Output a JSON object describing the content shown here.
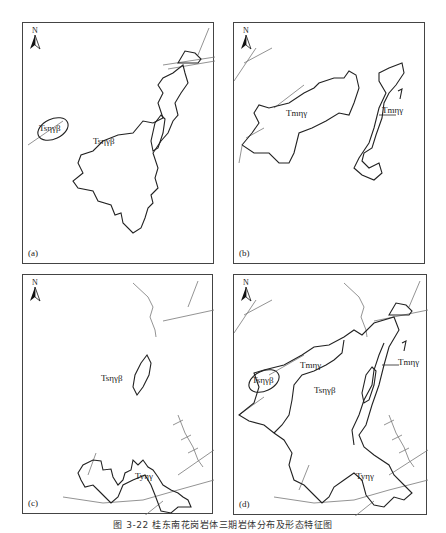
{
  "figure": {
    "caption": "图 3-22  桂东南花岗岩体三期岩体分布及形态特征图"
  },
  "north_arrow": {
    "label": "N"
  },
  "panels": [
    {
      "id": "a",
      "label": "(a)",
      "units": [
        {
          "text": "Tsηγβ"
        },
        {
          "text": "Tsηγβ"
        }
      ]
    },
    {
      "id": "b",
      "label": "(b)",
      "units": [
        {
          "text": "Tmηγ"
        },
        {
          "text": "Tmηγ"
        }
      ]
    },
    {
      "id": "c",
      "label": "(c)",
      "units": [
        {
          "text": "Tsηγβ"
        },
        {
          "text": "Tyηγ"
        }
      ]
    },
    {
      "id": "d",
      "label": "(d)",
      "units": [
        {
          "text": "Tmηγ"
        },
        {
          "text": "Tmηγ"
        },
        {
          "text": "Tsηγβ"
        },
        {
          "text": "Tsηγβ"
        },
        {
          "text": "Tyηγ"
        }
      ]
    }
  ],
  "colors": {
    "boundary": "#222222",
    "fault": "#777777",
    "frame": "#444444"
  }
}
